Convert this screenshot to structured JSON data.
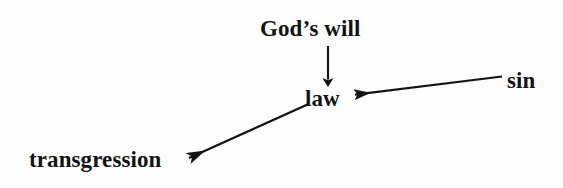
{
  "diagram": {
    "background_color": "#fdfdfd",
    "ink_color": "#131313",
    "nodes": [
      {
        "id": "gods_will",
        "label": "God’s will",
        "x": 260,
        "y": 17
      },
      {
        "id": "law",
        "label": "law",
        "x": 305,
        "y": 87
      },
      {
        "id": "sin",
        "label": "sin",
        "x": 507,
        "y": 69
      },
      {
        "id": "transgression",
        "label": "transgression",
        "x": 29,
        "y": 148
      }
    ],
    "edges": [
      {
        "id": "gods_will_to_law",
        "from": "gods_will",
        "to": "law",
        "direction": "down",
        "start": {
          "x": 328,
          "y": 46
        },
        "end": {
          "x": 328,
          "y": 86
        }
      },
      {
        "id": "sin_to_law",
        "from": "sin",
        "to": "law",
        "direction": "left-down",
        "start": {
          "x": 502,
          "y": 77
        },
        "end": {
          "x": 352,
          "y": 95
        }
      },
      {
        "id": "law_to_transgression",
        "from": "law",
        "to": "transgression",
        "direction": "left-down",
        "start": {
          "x": 307,
          "y": 105
        },
        "end": {
          "x": 185,
          "y": 160
        }
      }
    ]
  }
}
